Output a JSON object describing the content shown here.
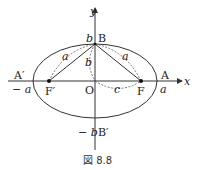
{
  "figure": {
    "caption": "図 8.8",
    "axes": {
      "x_label": "x",
      "y_label": "y",
      "origin_label": "O"
    },
    "points": {
      "A": "A",
      "A_prime": "A′",
      "B": "B",
      "B_prime": "B′",
      "F": "F",
      "F_prime": "F′"
    },
    "values": {
      "a": "a",
      "neg_a": "− a",
      "b": "b",
      "neg_b": "− b",
      "c": "c"
    },
    "segment_labels": {
      "left_a": "a",
      "right_a": "a",
      "center_b": "b",
      "c": "c"
    }
  }
}
